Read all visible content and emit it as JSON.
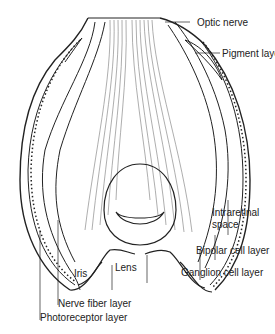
{
  "figure": {
    "labels": {
      "optic_nerve": "Optic nerve",
      "pigment_layer": "Pigment layer",
      "intraretinal_space_1": "Intraretinal",
      "intraretinal_space_2": "space",
      "bipolar_cell_layer": "Bipolar cell layer",
      "ganglion_cell_layer": "Ganglion cell layer",
      "lens": "Lens",
      "iris": "Iris",
      "nerve_fiber_layer": "Nerve fiber layer",
      "photoreceptor_layer": "Photoreceptor layer"
    },
    "colors": {
      "line": "#222222",
      "fiber": "#777777",
      "background": "#ffffff"
    }
  }
}
